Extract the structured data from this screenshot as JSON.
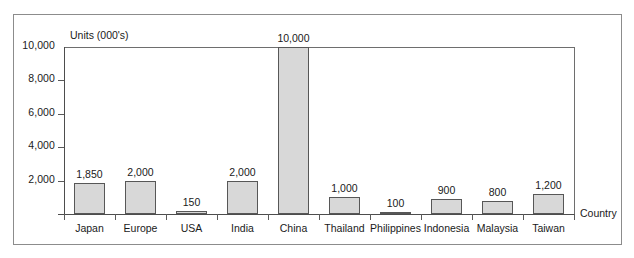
{
  "chart_data": {
    "type": "bar",
    "title": "",
    "xlabel": "Country",
    "ylabel": "Units (000's)",
    "categories": [
      "Japan",
      "Europe",
      "USA",
      "India",
      "China",
      "Thailand",
      "Philippines",
      "Indonesia",
      "Malaysia",
      "Taiwan"
    ],
    "values": [
      1850,
      2000,
      150,
      2000,
      10000,
      1000,
      100,
      900,
      800,
      1200
    ],
    "value_labels": [
      "1,850",
      "2,000",
      "150",
      "2,000",
      "10,000",
      "1,000",
      "100",
      "900",
      "800",
      "1,200"
    ],
    "ylim": [
      0,
      10000
    ],
    "y_ticks": [
      2000,
      4000,
      6000,
      8000,
      10000
    ],
    "y_tick_labels": [
      "2,000",
      "4,000",
      "6,000",
      "8,000",
      "10,000"
    ],
    "grid": false,
    "legend": "none",
    "bar_fill_color": "#d8d8d8",
    "bar_edge_color": "#575757",
    "axis_color": "#4d4d4d",
    "frame_color": "#8c8c8c",
    "background_color": "#ffffff"
  }
}
